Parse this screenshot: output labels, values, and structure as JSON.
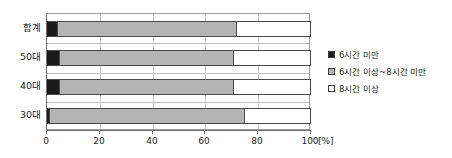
{
  "chart_data": {
    "type": "bar",
    "orientation": "horizontal",
    "stacked": true,
    "title": "",
    "xlabel": "[%]",
    "ylabel": "",
    "xlim": [
      0,
      100
    ],
    "xticks": [
      0,
      20,
      40,
      60,
      80,
      100
    ],
    "xtick_labels": [
      "0",
      "20",
      "40",
      "60",
      "80",
      "100"
    ],
    "x_unit": "[%]",
    "grid": true,
    "legend_position": "right",
    "categories": [
      "합계",
      "50대",
      "40대",
      "30대"
    ],
    "series": [
      {
        "name": "6시간 미만",
        "color": "#1a1a1a",
        "values": [
          4,
          5,
          5,
          1
        ]
      },
      {
        "name": "6시간 이상~8시간 미만",
        "color": "#b4b4b4",
        "values": [
          68,
          66,
          66,
          74
        ]
      },
      {
        "name": "8시간 이상",
        "color": "#ffffff",
        "values": [
          28,
          29,
          29,
          25
        ]
      }
    ]
  },
  "legend": {
    "items": [
      {
        "label": "6시간 미만",
        "swatch": "black-square-icon"
      },
      {
        "label": "6시간 이상~8시간 미만",
        "swatch": "gray-square-icon"
      },
      {
        "label": "8시간 이상",
        "swatch": "white-square-icon"
      }
    ]
  },
  "axis": {
    "x_tick_labels": [
      "0",
      "20",
      "40",
      "60",
      "80",
      "100"
    ],
    "x_unit": "[%]",
    "y_tick_labels": [
      "합계",
      "50대",
      "40대",
      "30대"
    ]
  },
  "colors": {
    "series_1": "#1a1a1a",
    "series_2": "#b4b4b4",
    "series_3": "#ffffff",
    "grid": "#c8c8c8",
    "axis": "#6f6f6f",
    "text": "#231f20"
  }
}
